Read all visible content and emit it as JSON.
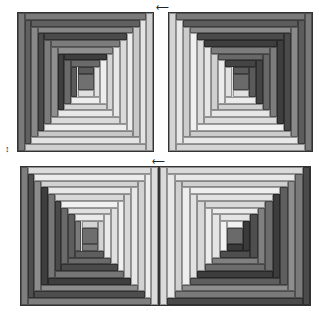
{
  "figure": {
    "arrows": [
      {
        "name": "top-rotation-arrow",
        "glyph": "⟵",
        "x": 156,
        "y": 3
      },
      {
        "name": "left-rotation-arrow",
        "glyph": "↕",
        "x": 5,
        "y": 145
      },
      {
        "name": "middle-rotation-arrow",
        "glyph": "⟵",
        "x": 152,
        "y": 157
      }
    ],
    "caption": ". .      . ."
  },
  "palette": {
    "dark": "#4a4a4a",
    "darkmid": "#6a6a6a",
    "mid": "#8a8a8a",
    "midlight": "#a8a8a8",
    "light": "#d4d4d4",
    "lighter": "#e6e6e6",
    "pale": "#f0f0f0"
  },
  "blocks": [
    {
      "name": "quilt-block-top-left",
      "x": 17,
      "y": 12,
      "w": 137,
      "h": 140,
      "dark_sides": [
        "top",
        "left"
      ],
      "dark_colors": [
        "#7a7a7a",
        "#606060",
        "#888888",
        "#4a4a4a",
        "#7c7c7c",
        "#8f8f8f",
        "#3e3e3e",
        "#6a6a6a",
        "#5a5a5a"
      ],
      "light_colors": [
        "#d0d0d0",
        "#e4e4e4",
        "#c8c8c8",
        "#ececec",
        "#dadada",
        "#e8e8e8",
        "#d6d6d6",
        "#eeeeee",
        "#e0e0e0"
      ],
      "center": "#707070"
    },
    {
      "name": "quilt-block-top-right",
      "x": 168,
      "y": 12,
      "w": 145,
      "h": 140,
      "dark_sides": [
        "top",
        "right"
      ],
      "dark_colors": [
        "#7a7a7a",
        "#5c5c5c",
        "#8a8a8a",
        "#4a4a4a",
        "#3e3e3e",
        "#7c7c7c",
        "#686868",
        "#444444",
        "#5a5a5a"
      ],
      "light_colors": [
        "#d4d4d4",
        "#e8e8e8",
        "#cccccc",
        "#f0f0f0",
        "#dcdcdc",
        "#e6e6e6",
        "#d0d0d0",
        "#ececec",
        "#e2e2e2"
      ],
      "center": "#6a6a6a"
    },
    {
      "name": "quilt-block-bottom-left",
      "x": 20,
      "y": 166,
      "w": 139,
      "h": 140,
      "dark_sides": [
        "bottom",
        "left"
      ],
      "dark_colors": [
        "#7e7e7e",
        "#4e4e4e",
        "#8c8c8c",
        "#3e3e3e",
        "#767676",
        "#4a4a4a",
        "#6a6a6a",
        "#5e5e5e",
        "#7a7a7a"
      ],
      "light_colors": [
        "#dcdcdc",
        "#ececec",
        "#d2d2d2",
        "#e8e8e8",
        "#d8d8d8",
        "#f0f0f0",
        "#e0e0e0",
        "#eaeaea",
        "#d4d4d4"
      ],
      "center": "#6e6e6e"
    },
    {
      "name": "quilt-block-bottom-right",
      "x": 159,
      "y": 166,
      "w": 152,
      "h": 140,
      "dark_sides": [
        "bottom",
        "right"
      ],
      "dark_colors": [
        "#4a4a4a",
        "#7a7a7a",
        "#8e8e8e",
        "#5e5e5e",
        "#3c3c3c",
        "#6c6c6c",
        "#808080",
        "#4e4e4e",
        "#3a3a3a"
      ],
      "light_colors": [
        "#dadada",
        "#e8e8e8",
        "#d0d0d0",
        "#eeeeee",
        "#e2e2e2",
        "#d8d8d8",
        "#ececec",
        "#e4e4e4",
        "#f2f2f2"
      ],
      "center": "#6a6a6a"
    }
  ]
}
